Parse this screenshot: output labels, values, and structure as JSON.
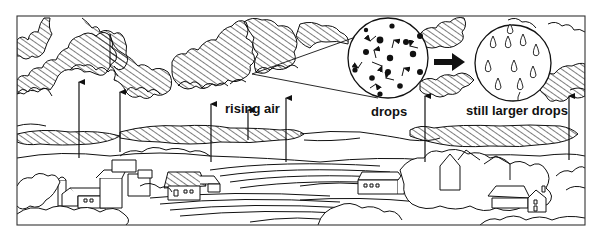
{
  "diagram": {
    "labels": {
      "rising_air": "rising air",
      "drops": "drops",
      "larger_drops": "still larger drops"
    },
    "colors": {
      "ink": "#111111",
      "paper": "#ffffff"
    },
    "elements": {
      "clouds": "hatched cumulus clouds",
      "arrows": "upward rising-air arrows",
      "inset_small": "magnified circle of small colliding droplets",
      "inset_large": "magnified circle of larger teardrop drops",
      "transition_arrow": "thick right-pointing arrow",
      "landscape": "farm village with barns, silo, trees and plowed fields"
    }
  }
}
